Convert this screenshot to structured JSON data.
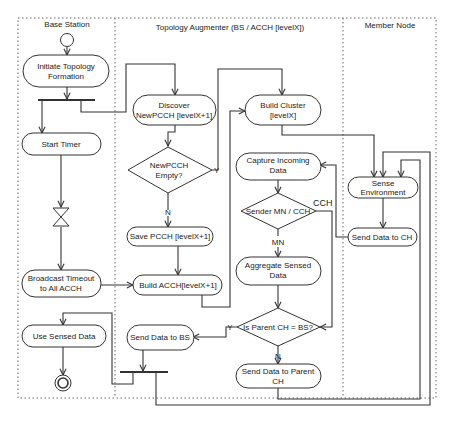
{
  "diagram": {
    "type": "activity-diagram",
    "colors": {
      "stroke": "#333333",
      "frame": "#555555",
      "background": "#ffffff",
      "text": "#222222"
    },
    "lanes": [
      {
        "id": "base-station",
        "title": "Base Station"
      },
      {
        "id": "topology-augmenter",
        "title": "Topology Augmenter (BS / ACCH [levelX])"
      },
      {
        "id": "member-node",
        "title": "Member Node"
      }
    ],
    "nodes": {
      "initiate": {
        "line1": "Initiate Topology",
        "line2": "Formation"
      },
      "start_timer": {
        "line1": "Start Timer"
      },
      "broadcast": {
        "line1": "Broadcast Timeout",
        "line2": "to All ACCH"
      },
      "use_sensed": {
        "line1": "Use Sensed Data"
      },
      "discover": {
        "line1": "Discover",
        "line2": "NewPCCH [levelX+1]"
      },
      "newpcch_empty": {
        "line1": "NewPCCH",
        "line2": "Empty?"
      },
      "save_pcch": {
        "line1": "Save PCCH [levelX+1]"
      },
      "build_acch": {
        "line1": "Build ACCH[levelX+1]"
      },
      "send_bs": {
        "line1": "Send Data to BS"
      },
      "build_cluster": {
        "line1": "Build Cluster",
        "line2": "[levelX]"
      },
      "capture": {
        "line1": "Capture Incoming",
        "line2": "Data"
      },
      "sender": {
        "line1": "Sender MN / CCH"
      },
      "aggregate": {
        "line1": "Aggregate Sensed",
        "line2": "Data"
      },
      "is_parent": {
        "line1": "Is Parent CH = BS?"
      },
      "send_parent": {
        "line1": "Send Data to Parent",
        "line2": "CH"
      },
      "sense_env": {
        "line1": "Sense",
        "line2": "Environment"
      },
      "send_ch": {
        "line1": "Send Data to CH"
      }
    },
    "edge_labels": {
      "newpcch_yes": "Y",
      "newpcch_no": "N",
      "sender_cch": "CCH",
      "sender_mn": "MN",
      "parent_yes": "Y",
      "parent_no": "N"
    }
  }
}
